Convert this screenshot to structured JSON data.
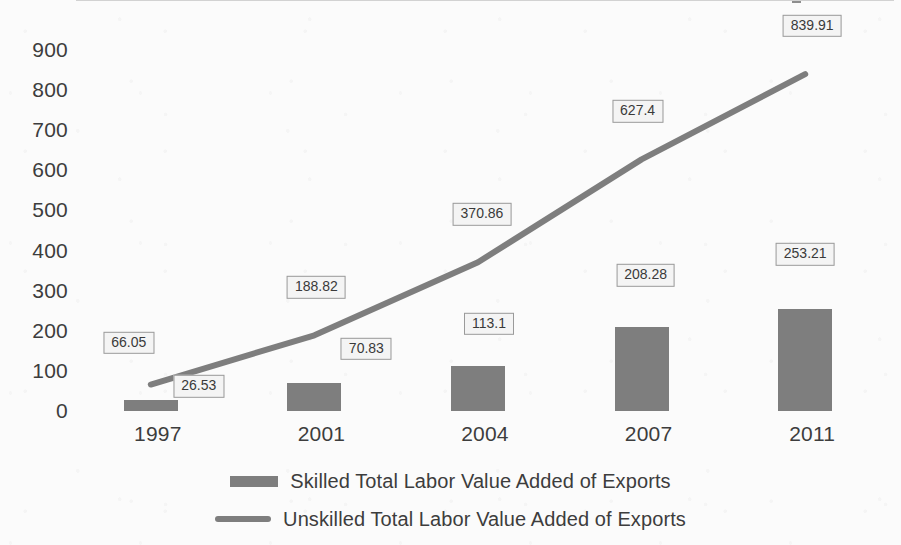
{
  "chart_data": {
    "type": "bar",
    "title": "",
    "xlabel": "",
    "ylabel": "",
    "categories": [
      "1997",
      "2001",
      "2004",
      "2007",
      "2011"
    ],
    "ylim": [
      0,
      900
    ],
    "ytick_labels": [
      "900",
      "800",
      "700",
      "600",
      "500",
      "400",
      "300",
      "200",
      "100",
      "0"
    ],
    "ytick_values": [
      900,
      800,
      700,
      600,
      500,
      400,
      300,
      200,
      100,
      0
    ],
    "grid": false,
    "legend_position": "bottom",
    "series": [
      {
        "name": "Skilled Total Labor Value Added of Exports",
        "type": "bar",
        "color": "#7e7e7e",
        "values": [
          26.53,
          70.83,
          113.1,
          208.28,
          253.21
        ],
        "labels": [
          "26.53",
          "70.83",
          "113.1",
          "208.28",
          "253.21"
        ]
      },
      {
        "name": "Unskilled Total Labor Value Added of Exports",
        "type": "line",
        "color": "#7e7e7e",
        "values": [
          66.05,
          188.82,
          370.86,
          627.4,
          839.91
        ],
        "labels": [
          "66.05",
          "188.82",
          "370.86",
          "627.4",
          "839.91"
        ]
      }
    ]
  },
  "legend": {
    "items": [
      {
        "label": "Skilled Total Labor Value Added of Exports",
        "marker": "bar-swatch"
      },
      {
        "label": "Unskilled Total Labor Value Added of Exports",
        "marker": "line-swatch"
      }
    ]
  }
}
